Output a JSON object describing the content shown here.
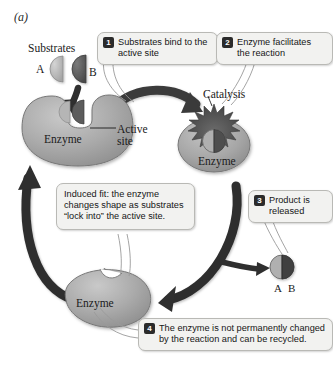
{
  "figure": {
    "panel_label": "(a)"
  },
  "labels": {
    "substrates": "Substrates",
    "substrate_a": "A",
    "substrate_b": "B",
    "catalysis": "Catalysis",
    "active_site": "Active\nsite",
    "active_site_line1": "Active",
    "active_site_line2": "site",
    "enzyme_1": "Enzyme",
    "enzyme_2": "Enzyme",
    "enzyme_3": "Enzyme",
    "product_ab": "A B"
  },
  "steps": [
    {
      "number": "1",
      "text": "Substrates bind to the active site"
    },
    {
      "number": "2",
      "text": "Enzyme facilitates the reaction"
    },
    {
      "number": "3",
      "text": "Product is released"
    },
    {
      "number": "4",
      "text": "The enzyme is not permanently changed by the reaction and can be recycled."
    }
  ],
  "notes": {
    "induced_fit": "Induced fit: the enzyme changes shape as substrates “lock into” the active site."
  },
  "colors": {
    "enzyme_fill": "#a8a8a8",
    "enzyme_stroke": "#6e6e6e",
    "substrate_a": "#b8b8b8",
    "substrate_b": "#5a5a5a",
    "catalysis_burst": "#4a4a4a",
    "arrow": "#2f2f2f",
    "callout_bg": "#f2f2f0",
    "callout_border": "#b9b9b5",
    "badge_bg": "#2b2b2b",
    "background": "#ffffff"
  }
}
